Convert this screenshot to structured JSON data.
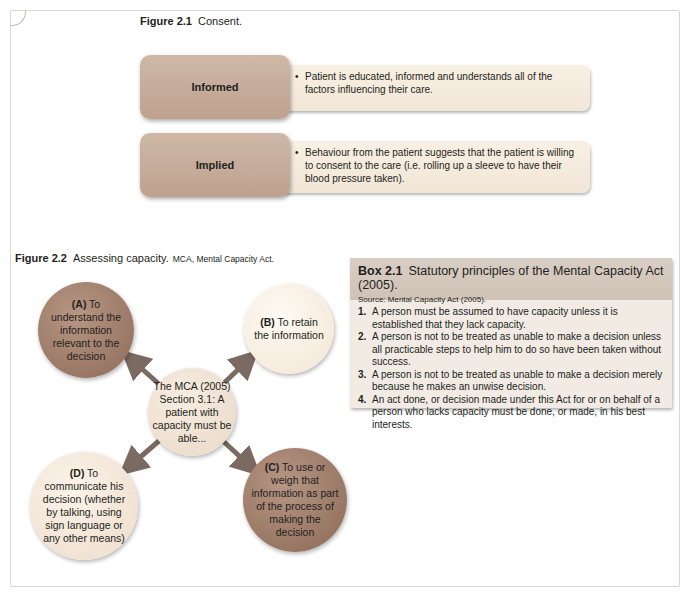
{
  "figure_2_1": {
    "number": "Figure 2.1",
    "title": "Consent.",
    "rows": [
      {
        "label": "Informed",
        "text": "Patient is educated, informed and understands all of the factors influencing their care."
      },
      {
        "label": "Implied",
        "text": "Behaviour from the patient suggests that the patient is willing to consent to the care (i.e. rolling up a sleeve to have their blood pressure taken)."
      }
    ]
  },
  "figure_2_2": {
    "number": "Figure 2.2",
    "title": "Assessing capacity.",
    "subtitle": "MCA, Mental Capacity Act.",
    "center": "The MCA (2005) Section 3.1: A patient with capacity must be able...",
    "nodes": {
      "a": {
        "letter": "(A)",
        "text": "To understand the information relevant to the decision"
      },
      "b": {
        "letter": "(B)",
        "text": "To retain the information"
      },
      "c": {
        "letter": "(C)",
        "text": "To use or weigh that information as part of the process of making the decision"
      },
      "d": {
        "letter": "(D)",
        "text": "To communicate his decision (whether by talking, using sign language or any other means)"
      }
    }
  },
  "box_2_1": {
    "number": "Box 2.1",
    "title": "Statutory principles of the Mental Capacity Act (2005).",
    "source": "Source: Mental Capacity Act (2005).",
    "items": [
      {
        "num": "1.",
        "text": "A person must be assumed to have capacity unless it is established that they lack capacity."
      },
      {
        "num": "2.",
        "text": "A person is not to be treated as unable to make a decision unless all practicable steps to help him to do so have been taken without success."
      },
      {
        "num": "3.",
        "text": "A person is not to be treated as unable to make a decision merely because he makes an unwise decision."
      },
      {
        "num": "4.",
        "text": "An act done, or decision made under this Act for or on behalf of a person who lacks capacity must be done, or made, in his best interests."
      }
    ]
  },
  "colors": {
    "label_fill": "#c5ab99",
    "desc_fill": "#f5ebdd",
    "dark_circle": "#9c7a67",
    "light_circle": "#f5e9da",
    "arrow": "#7a6a62",
    "box_fill": "#f1ebe4",
    "box_header": "#d4c8bd"
  }
}
